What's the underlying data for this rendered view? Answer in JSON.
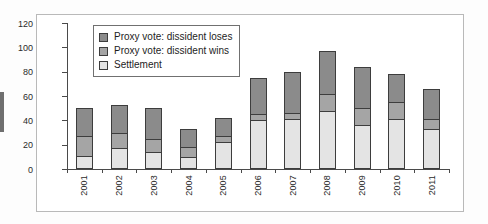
{
  "chart_data": {
    "type": "bar",
    "stacked": true,
    "title": "",
    "xlabel": "",
    "ylabel": "",
    "ylim": [
      0,
      120
    ],
    "ytick_step": 20,
    "yticks": [
      0,
      20,
      40,
      60,
      80,
      100,
      120
    ],
    "grid": false,
    "legend_position": "top-left",
    "categories": [
      "2001",
      "2002",
      "2003",
      "2004",
      "2005",
      "2006",
      "2007",
      "2008",
      "2009",
      "2010",
      "2011"
    ],
    "series": [
      {
        "name": "Settlement",
        "color": "#e4e4e4",
        "values": [
          11,
          17,
          14,
          10,
          22,
          40,
          41,
          48,
          36,
          41,
          33
        ]
      },
      {
        "name": "Proxy vote: dissident wins",
        "color": "#a5a5a5",
        "values": [
          16,
          13,
          11,
          8,
          5,
          5,
          5,
          14,
          14,
          14,
          8
        ]
      },
      {
        "name": "Proxy vote: dissident loses",
        "color": "#8b8b8b",
        "values": [
          23,
          23,
          25,
          15,
          15,
          30,
          34,
          35,
          34,
          23,
          25
        ]
      }
    ],
    "totals": [
      50,
      53,
      50,
      33,
      42,
      75,
      80,
      97,
      84,
      78,
      66
    ]
  },
  "legend": {
    "entries": [
      {
        "label": "Proxy vote: dissident loses",
        "color": "#8b8b8b"
      },
      {
        "label": "Proxy vote: dissident wins",
        "color": "#a5a5a5"
      },
      {
        "label": "Settlement",
        "color": "#e4e4e4"
      }
    ]
  }
}
